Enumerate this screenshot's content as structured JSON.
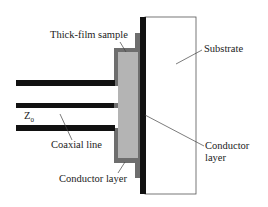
{
  "diagram": {
    "labels": {
      "thick_film_sample": "Thick-film sample",
      "substrate": "Substrate",
      "z0": "Z",
      "z0_sub": "0",
      "coaxial_line": "Coaxial line",
      "conductor_layer_bottom": "Conductor layer",
      "conductor_layer_right_1": "Conductor",
      "conductor_layer_right_2": "layer"
    },
    "colors": {
      "conductor": "#111111",
      "outer_conductor": "#6e6e6e",
      "sample": "#b4b4b4",
      "substrate": "#ffffff",
      "outline": "#555555"
    }
  }
}
